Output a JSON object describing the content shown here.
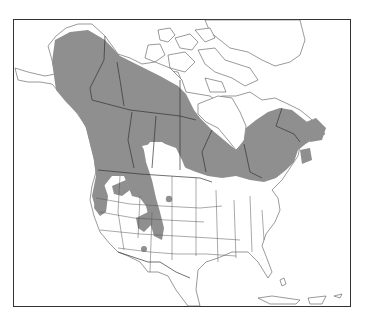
{
  "map": {
    "title_fragment": "",
    "region": "North America",
    "type": "species range map",
    "colors": {
      "background": "#ffffff",
      "range_fill": "#8f8f8f",
      "outline": "#555555",
      "frame": "#333333"
    },
    "range_areas": [
      "Alaska interior",
      "Yukon",
      "Northwest Territories (south)",
      "British Columbia",
      "Alberta (north & west)",
      "Saskatchewan (north)",
      "Manitoba (north)",
      "Ontario (north)",
      "Quebec",
      "Labrador",
      "Newfoundland",
      "Maritime provinces",
      "Pacific Northwest (Washington, Oregon)",
      "Northern Rocky Mountains (Idaho, Montana)",
      "Wyoming / Colorado Rockies",
      "Utah (isolated patch)",
      "Arizona (isolated patch)",
      "Black Hills (isolated patch)",
      "New England / Great Lakes north shore"
    ]
  }
}
